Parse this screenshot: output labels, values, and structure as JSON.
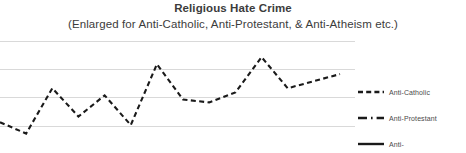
{
  "chart_data": {
    "type": "line",
    "title": "Religious Hate Crime",
    "subtitle": "(Enlarged for Anti-Catholic, Anti-Protestant, & Anti-Atheism etc.)",
    "xlabel": "",
    "ylabel": "",
    "grid": true,
    "gridlines": 4,
    "ylim": [
      0,
      4
    ],
    "xlim": [
      0,
      13
    ],
    "legend_position": "right",
    "series": [
      {
        "name": "Anti-Catholic",
        "style": "dashed",
        "color": "#1a1a1a",
        "x": [
          0,
          1,
          2,
          3,
          4,
          5,
          6,
          7,
          8,
          9,
          10,
          11,
          12,
          13
        ],
        "values": [
          1.15,
          0.75,
          2.35,
          1.35,
          2.1,
          1.05,
          3.2,
          1.95,
          1.85,
          2.2,
          3.45,
          2.35,
          2.6,
          2.85
        ]
      },
      {
        "name": "Anti-Protestant",
        "style": "dash-dot",
        "color": "#1a1a1a",
        "x": [],
        "values": []
      },
      {
        "name": "Anti-",
        "style": "solid",
        "color": "#1a1a1a",
        "x": [],
        "values": []
      }
    ]
  },
  "chart": {
    "title": "Religious Hate Crime",
    "subtitle": "(Enlarged for Anti-Catholic, Anti-Protestant, & Anti-Atheism etc.)"
  },
  "legend": {
    "items": [
      {
        "label": "Anti-Catholic",
        "style": "dashed"
      },
      {
        "label": "Anti-Protestant",
        "style": "dash-dot"
      },
      {
        "label": "Anti-",
        "style": "solid"
      }
    ]
  },
  "colors": {
    "line": "#1a1a1a",
    "gridline": "#d9d9d9",
    "text": "#3c3c3c",
    "legend_text": "#4a4a4a",
    "background": "#ffffff"
  }
}
